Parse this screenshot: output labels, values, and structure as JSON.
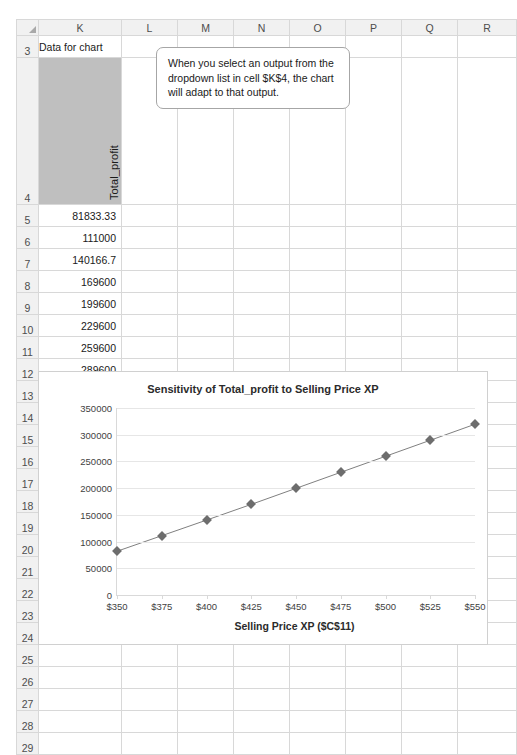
{
  "spreadsheet": {
    "columns": [
      "K",
      "L",
      "M",
      "N",
      "O",
      "P",
      "Q",
      "R"
    ],
    "rows": [
      {
        "num": "3",
        "k": "Data for chart"
      },
      {
        "num": "4",
        "k": "Total_profit"
      },
      {
        "num": "5",
        "k": "81833.33"
      },
      {
        "num": "6",
        "k": "111000"
      },
      {
        "num": "7",
        "k": "140166.7"
      },
      {
        "num": "8",
        "k": "169600"
      },
      {
        "num": "9",
        "k": "199600"
      },
      {
        "num": "10",
        "k": "229600"
      },
      {
        "num": "11",
        "k": "259600"
      },
      {
        "num": "12",
        "k": "289600"
      },
      {
        "num": "13",
        "k": "319600"
      },
      {
        "num": "14",
        "k": ""
      },
      {
        "num": "15",
        "k": ""
      },
      {
        "num": "16",
        "k": ""
      },
      {
        "num": "17",
        "k": ""
      },
      {
        "num": "18",
        "k": ""
      },
      {
        "num": "19",
        "k": ""
      },
      {
        "num": "20",
        "k": ""
      },
      {
        "num": "21",
        "k": ""
      },
      {
        "num": "22",
        "k": ""
      },
      {
        "num": "23",
        "k": ""
      },
      {
        "num": "24",
        "k": ""
      },
      {
        "num": "25",
        "k": ""
      },
      {
        "num": "26",
        "k": ""
      },
      {
        "num": "27",
        "k": ""
      },
      {
        "num": "28",
        "k": ""
      },
      {
        "num": "29",
        "k": ""
      }
    ],
    "header_cell_label": "Total_profit",
    "data_title": "Data for chart"
  },
  "callout": {
    "text": "When you select an output from the dropdown list in cell $K$4, the chart will adapt to that output."
  },
  "chart_data": {
    "type": "line",
    "title": "Sensitivity of Total_profit to Selling Price XP",
    "xlabel": "Selling Price XP ($C$11)",
    "ylabel": "",
    "x": [
      350,
      375,
      400,
      425,
      450,
      475,
      500,
      525,
      550
    ],
    "xtick_labels": [
      "$350",
      "$375",
      "$400",
      "$425",
      "$450",
      "$475",
      "$500",
      "$525",
      "$550"
    ],
    "values": [
      81833.33,
      111000,
      140166.7,
      169600,
      199600,
      229600,
      259600,
      289600,
      319600
    ],
    "ytick_labels": [
      "0",
      "50000",
      "100000",
      "150000",
      "200000",
      "250000",
      "300000",
      "350000"
    ],
    "yticks": [
      0,
      50000,
      100000,
      150000,
      200000,
      250000,
      300000,
      350000
    ],
    "ylim": [
      0,
      350000
    ],
    "grid": true,
    "legend": "none",
    "series_name": "Total_profit",
    "line_color": "#808080",
    "marker_color": "#6d6d6d"
  }
}
